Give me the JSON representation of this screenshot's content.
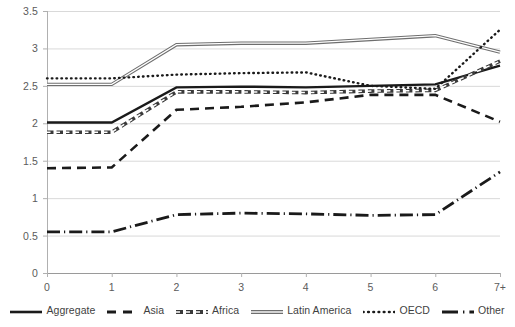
{
  "chart_data": {
    "type": "line",
    "title": "",
    "xlabel": "",
    "ylabel": "",
    "x": [
      "0",
      "1",
      "2",
      "3",
      "4",
      "5",
      "6",
      "7+"
    ],
    "categories": [
      "0",
      "1",
      "2",
      "3",
      "4",
      "5",
      "6",
      "7+"
    ],
    "ylim": [
      0,
      3.5
    ],
    "yticks": [
      "0",
      "0.5",
      "1",
      "1.5",
      "2",
      "2.5",
      "3",
      "3.5"
    ],
    "ytick_values": [
      0,
      0.5,
      1,
      1.5,
      2,
      2.5,
      3,
      3.5
    ],
    "grid": "horizontal",
    "legend_position": "bottom",
    "series": [
      {
        "name": "Aggregate",
        "style": "solid",
        "color": "#1a1a1a",
        "values": [
          2.01,
          2.01,
          2.48,
          2.49,
          2.48,
          2.5,
          2.52,
          2.77
        ]
      },
      {
        "name": "Asia",
        "style": "dashed",
        "color": "#1a1a1a",
        "values": [
          1.4,
          1.41,
          2.18,
          2.22,
          2.28,
          2.38,
          2.38,
          2.02
        ]
      },
      {
        "name": "Africa",
        "style": "small-dash-outline",
        "color": "#3a3a3a",
        "values": [
          1.88,
          1.88,
          2.42,
          2.42,
          2.41,
          2.43,
          2.44,
          2.83
        ]
      },
      {
        "name": "Latin America",
        "style": "double-solid",
        "color": "#6e6e6e",
        "values": [
          2.52,
          2.52,
          3.05,
          3.07,
          3.07,
          3.12,
          3.17,
          2.95
        ]
      },
      {
        "name": "OECD",
        "style": "dotted",
        "color": "#1a1a1a",
        "values": [
          2.6,
          2.6,
          2.65,
          2.67,
          2.68,
          2.5,
          2.46,
          3.25
        ]
      },
      {
        "name": "Other",
        "style": "dash-dot",
        "color": "#1a1a1a",
        "values": [
          0.55,
          0.55,
          0.78,
          0.8,
          0.79,
          0.77,
          0.78,
          1.35
        ]
      }
    ]
  },
  "legend": {
    "items": [
      {
        "label": "Aggregate"
      },
      {
        "label": "Asia"
      },
      {
        "label": "Africa"
      },
      {
        "label": "Latin America"
      },
      {
        "label": "OECD"
      },
      {
        "label": "Other"
      }
    ]
  }
}
